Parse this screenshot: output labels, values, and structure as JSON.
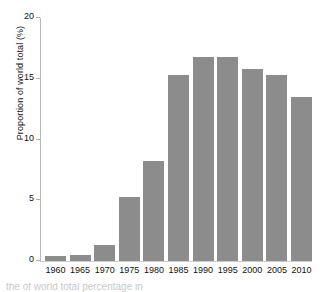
{
  "chart_data": {
    "type": "bar",
    "title": "",
    "xlabel": "",
    "ylabel": "Proportion of world total (%)",
    "categories": [
      "1960",
      "1965",
      "1970",
      "1975",
      "1980",
      "1985",
      "1990",
      "1995",
      "2000",
      "2005",
      "2010"
    ],
    "values": [
      0.4,
      0.5,
      1.3,
      5.3,
      8.2,
      15.3,
      16.8,
      16.8,
      15.8,
      15.3,
      13.5
    ],
    "ylim": [
      0,
      20
    ],
    "yticks": [
      0,
      5,
      10,
      15,
      20
    ],
    "ytick_labels": [
      "0",
      "5",
      "10",
      "15",
      "20"
    ],
    "grid": false,
    "legend": null,
    "bar_color": "#8c8c8c",
    "axis_color": "#b8b8b8",
    "text_color": "#111111"
  },
  "caption": {
    "clipped_text": "the of world total percentage in"
  }
}
